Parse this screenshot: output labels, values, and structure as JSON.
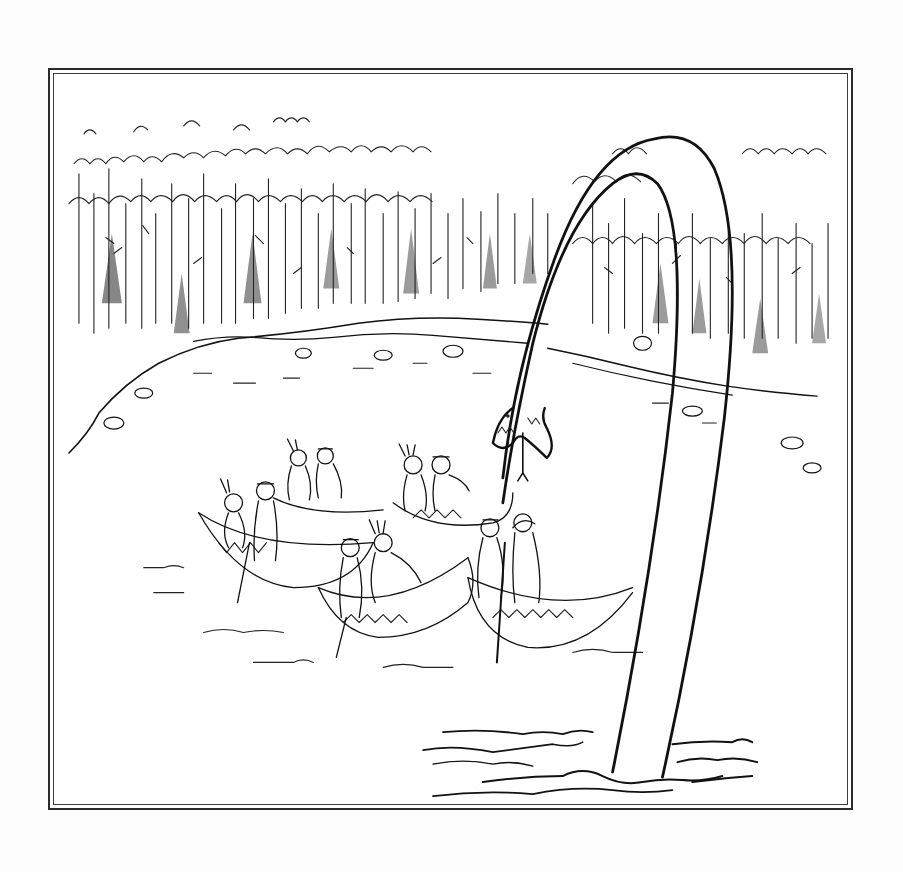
{
  "illustration": {
    "style": "black-and-white pen-and-ink cartoon",
    "caption": "",
    "frame": {
      "type": "double-line border",
      "color": "#2a2a2a",
      "background": "#ffffff"
    },
    "scene": {
      "background": "dense forest of trees along the far shoreline of a lake",
      "midground": "rocky shoreline curving around the lake",
      "foreground_left": "four canoes carrying Native American figures with feathered headbands, looking up",
      "foreground_right": "a giant long-necked sea serpent arching out of the water, head hanging down with open toothed jaw and forked tongue",
      "water": "wavy ripple lines around the serpent's neck base"
    },
    "elements": [
      {
        "name": "forest",
        "description": "treeline with pines"
      },
      {
        "name": "shoreline",
        "description": "rocky shore"
      },
      {
        "name": "canoe-1",
        "people": 2
      },
      {
        "name": "canoe-2",
        "people": 2
      },
      {
        "name": "canoe-3",
        "people": 2
      },
      {
        "name": "canoe-4",
        "people": 2
      },
      {
        "name": "canoe-5",
        "people": 2
      },
      {
        "name": "serpent",
        "description": "long neck arching over forest, head hanging near canoes"
      },
      {
        "name": "ripples",
        "description": "water waves at base of serpent neck"
      }
    ]
  }
}
